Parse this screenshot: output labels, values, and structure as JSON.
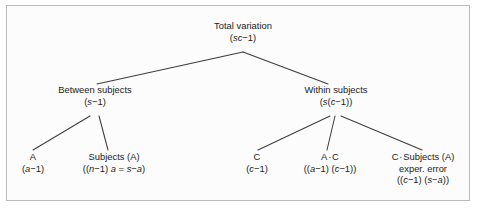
{
  "figure": {
    "type": "variance-decomposition-tree",
    "background_color": "#fcfcfc",
    "border_color": "#b9b9b9",
    "line_color": "#3c3c3c",
    "text_color": "#1b1b1b"
  },
  "nodes": {
    "root": {
      "title": "Total variation",
      "df_prefix": "(",
      "df_italic": "sc",
      "df_suffix": "−1)",
      "df_full": "(sc−1)"
    },
    "between": {
      "title": "Between subjects",
      "df_prefix": "(",
      "df_italic": "s",
      "df_suffix": "−1)",
      "df_full": "(s−1)"
    },
    "within": {
      "title": "Within subjects",
      "df_prefix": "(",
      "df_italic": "s",
      "df_mid": "(",
      "df_italic2": "c",
      "df_suffix": "−1))",
      "df_full": "(s(c−1))"
    },
    "factor_a": {
      "title": "A",
      "df_prefix": "(",
      "df_italic": "a",
      "df_suffix": "−1)",
      "df_full": "(a−1)"
    },
    "subjects_a": {
      "title": "Subjects (A)",
      "df_full": "((n−1) a = s−a)",
      "df_p1": "((",
      "df_i1": "n",
      "df_p2": "−1) ",
      "df_i2": "a",
      "df_p3": " = ",
      "df_i3": "s",
      "df_p4": "−",
      "df_i4": "a",
      "df_p5": ")"
    },
    "factor_c": {
      "title": "C",
      "df_prefix": "(",
      "df_italic": "c",
      "df_suffix": "−1)",
      "df_full": "(c−1)"
    },
    "a_by_c": {
      "title_left": "A",
      "operator": "·",
      "title_right": "C",
      "title_full": "A · C",
      "df_full": "((a−1) (c−1))",
      "df_p1": "((",
      "df_i1": "a",
      "df_p2": "−1) (",
      "df_i2": "c",
      "df_p3": "−1))"
    },
    "c_by_subjects": {
      "title_left": "C",
      "operator": "·",
      "title_right": "Subjects (A)",
      "title_full": "C · Subjects (A)",
      "middle_line": "exper. error",
      "df_full": "((c−1) (s−a))",
      "df_p1": "((",
      "df_i1": "c",
      "df_p2": "−1) (",
      "df_i2": "s",
      "df_p3": "−",
      "df_i3": "a",
      "df_p4": "))"
    }
  }
}
